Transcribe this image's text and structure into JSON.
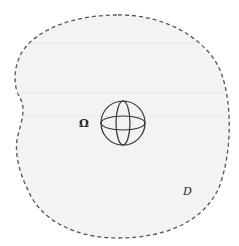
{
  "figure": {
    "type": "domain-diagram",
    "outer_region": {
      "label": "D",
      "outline_style": "dashed",
      "fill_color": "#f3f3f3",
      "stroke_color": "#555555"
    },
    "inner_object": {
      "label": "Ω",
      "shape": "sphere",
      "stroke_color": "#333333"
    }
  }
}
